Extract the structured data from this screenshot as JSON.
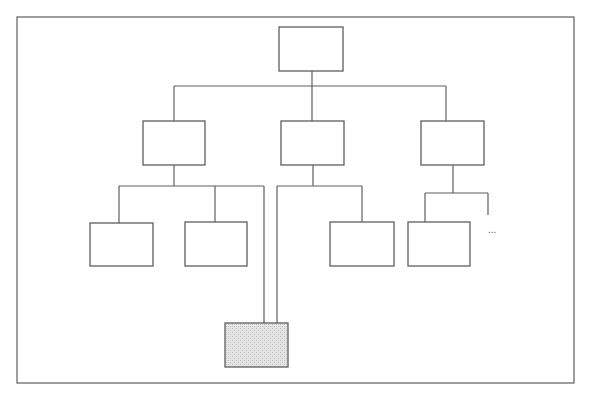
{
  "diagram": {
    "type": "org-chart",
    "colors": {
      "line": "#5e5e5e",
      "frame": "#6b6b6b",
      "node_fill": "#ffffff",
      "shaded_fill_light": "#e6e6e6",
      "shaded_fill_dark": "#bdbdbd"
    },
    "nodes": [
      {
        "id": "root",
        "label": "",
        "level": 0,
        "shaded": false
      },
      {
        "id": "l2-left",
        "label": "",
        "level": 1,
        "parent": "root",
        "shaded": false
      },
      {
        "id": "l2-middle",
        "label": "",
        "level": 1,
        "parent": "root",
        "shaded": false
      },
      {
        "id": "l2-right",
        "label": "",
        "level": 1,
        "parent": "root",
        "shaded": false
      },
      {
        "id": "l3-left-a",
        "label": "",
        "level": 2,
        "parent": "l2-left",
        "shaded": false
      },
      {
        "id": "l3-left-b",
        "label": "",
        "level": 2,
        "parent": "l2-left",
        "shaded": false
      },
      {
        "id": "l3-middle-a",
        "label": "",
        "level": 2,
        "parent": "l2-middle",
        "shaded": false
      },
      {
        "id": "l3-right-a",
        "label": "",
        "level": 2,
        "parent": "l2-right",
        "shaded": false
      },
      {
        "id": "shared-child",
        "label": "",
        "level": 3,
        "parents": [
          "l2-left",
          "l2-middle"
        ],
        "shaded": true
      }
    ],
    "continuation_marker": "..."
  }
}
